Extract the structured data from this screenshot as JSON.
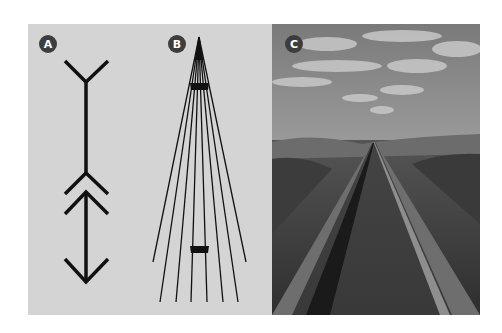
{
  "figure": {
    "panels": [
      {
        "id": "A",
        "label": "A",
        "description": "Müller-Lyer illusion: line with outward fins above and inward arrowheads below"
      },
      {
        "id": "B",
        "label": "B",
        "description": "Ponzo illusion: two equal bars between converging lines"
      },
      {
        "id": "C",
        "label": "C",
        "description": "Photograph of railroad tracks converging toward the horizon"
      }
    ],
    "colors": {
      "panel_background": "#d4d4d4",
      "badge_fill": "#3d3d3d",
      "badge_text": "#ffffff",
      "line": "#111111",
      "photo_sky": "#8c8c8c",
      "photo_ground": "#3a3a3a"
    }
  }
}
